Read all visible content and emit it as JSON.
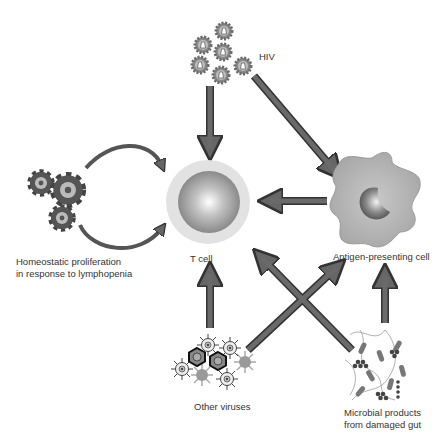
{
  "diagram": {
    "nodes": {
      "hiv": {
        "label": "HIV"
      },
      "t_cell": {
        "label": "T cell"
      },
      "apc": {
        "label": "Antigen-presenting cell"
      },
      "homeostatic": {
        "line1": "Homeostatic proliferation",
        "line2": "in response to lymphopenia"
      },
      "other_viruses": {
        "label": "Other viruses"
      },
      "microbial": {
        "line1": "Microbial products",
        "line2": "from damaged gut"
      }
    },
    "edges": [
      {
        "from": "HIV",
        "to": "T cell"
      },
      {
        "from": "HIV",
        "to": "Antigen-presenting cell"
      },
      {
        "from": "Antigen-presenting cell",
        "to": "T cell"
      },
      {
        "from": "Homeostatic proliferation",
        "to": "T cell",
        "type": "cycle"
      },
      {
        "from": "Other viruses",
        "to": "T cell"
      },
      {
        "from": "Other viruses",
        "to": "Antigen-presenting cell"
      },
      {
        "from": "Microbial products from damaged gut",
        "to": "T cell"
      },
      {
        "from": "Microbial products from damaged gut",
        "to": "Antigen-presenting cell"
      }
    ],
    "colors": {
      "arrow": "#666666",
      "arrow_outline": "#333333",
      "cell": "#aaaaaa"
    }
  }
}
